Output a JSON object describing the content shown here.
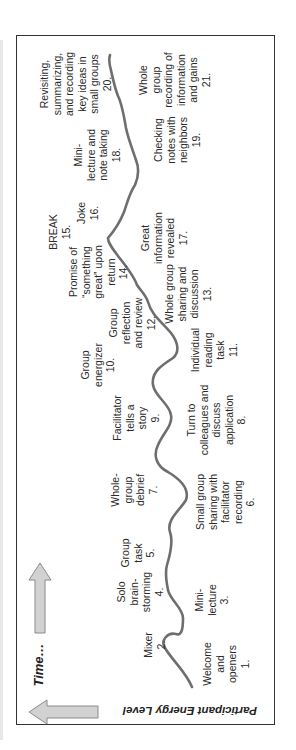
{
  "diagram": {
    "axis_labels": {
      "time": "Time…",
      "energy": "Participant Energy Level"
    },
    "colors": {
      "curve": "#6e6e6e",
      "arrow_fill": "#d2d2d2",
      "arrow_stroke": "#8a8a8a",
      "frame": "#333333"
    },
    "activities": [
      {
        "num": 1,
        "lines": [
          "Welcome",
          "and",
          "openers",
          "1."
        ]
      },
      {
        "num": 2,
        "lines": [
          "Mixer",
          "2."
        ]
      },
      {
        "num": 3,
        "lines": [
          "Mini-",
          "lecture",
          "3."
        ]
      },
      {
        "num": 4,
        "lines": [
          "Solo",
          "brain-",
          "storming",
          "4."
        ]
      },
      {
        "num": 5,
        "lines": [
          "Group",
          "task",
          "5."
        ]
      },
      {
        "num": 6,
        "lines": [
          "Small group",
          "sharing with",
          "facilitator",
          "recording",
          "6."
        ]
      },
      {
        "num": 7,
        "lines": [
          "Whole-",
          "group",
          "debrief",
          "7."
        ]
      },
      {
        "num": 8,
        "lines": [
          "Turn to",
          "colleagues and",
          "discuss",
          "application",
          "8."
        ]
      },
      {
        "num": 9,
        "lines": [
          "Facilitator",
          "tells a",
          "story",
          "9."
        ]
      },
      {
        "num": 10,
        "lines": [
          "Group",
          "energizer",
          "10."
        ]
      },
      {
        "num": 11,
        "lines": [
          "Individual",
          "reading",
          "task",
          "11."
        ]
      },
      {
        "num": 12,
        "lines": [
          "Group",
          "reflection",
          "and review",
          "12."
        ]
      },
      {
        "num": 13,
        "lines": [
          "Whole group",
          "sharing and",
          "discussion",
          "13."
        ]
      },
      {
        "num": 14,
        "lines": [
          "Promise of",
          "“something",
          "great” upon",
          "return",
          "14."
        ]
      },
      {
        "num": 15,
        "lines": [
          "BREAK",
          "15."
        ]
      },
      {
        "num": 16,
        "lines": [
          "Joke",
          "16."
        ]
      },
      {
        "num": 17,
        "lines": [
          "Great",
          "information",
          "revealed",
          "17."
        ]
      },
      {
        "num": 18,
        "lines": [
          "Mini-",
          "lecture and",
          "note taking",
          "18."
        ]
      },
      {
        "num": 19,
        "lines": [
          "Checking",
          "notes with",
          "neighbors",
          "19."
        ]
      },
      {
        "num": 20,
        "lines": [
          "Revisiting,",
          "summarizing,",
          "and recording",
          "key ideas in",
          "small groups",
          "20."
        ]
      },
      {
        "num": 21,
        "lines": [
          "Whole",
          "group",
          "recording of",
          "information",
          "and gains",
          "21."
        ]
      }
    ]
  }
}
